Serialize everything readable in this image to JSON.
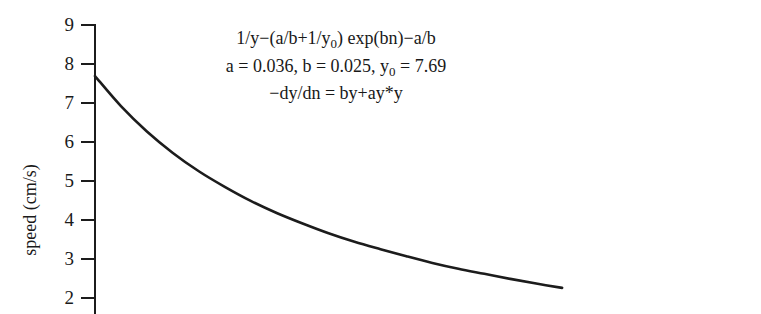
{
  "chart_data": {
    "type": "line",
    "title": "",
    "xlabel": "",
    "ylabel": "speed (cm/s)",
    "grid": false,
    "legend": null,
    "yticks": [
      9,
      8,
      7,
      6,
      5,
      4,
      3,
      2
    ],
    "ytick_labels": [
      "9",
      "8",
      "7",
      "6",
      "5",
      "4",
      "3",
      "2"
    ],
    "ylim": [
      2,
      9
    ],
    "xlim": [
      0,
      105
    ],
    "series": [
      {
        "name": "speed",
        "x": [
          0,
          5,
          10,
          15,
          20,
          25,
          30,
          35,
          40,
          45,
          50,
          55,
          60,
          65,
          70,
          75,
          80,
          85,
          90
        ],
        "y": [
          7.69,
          6.92,
          6.27,
          5.72,
          5.25,
          4.85,
          4.49,
          4.18,
          3.91,
          3.66,
          3.44,
          3.25,
          3.07,
          2.9,
          2.75,
          2.62,
          2.49,
          2.37,
          2.26
        ]
      }
    ],
    "annotations": {
      "equation_line1_parts": {
        "a": "1/y−(a/b+1/y",
        "sub": "0",
        "b": ") exp(bn)−a/b"
      },
      "equation_line2_parts": {
        "a": "a = 0.036, b = 0.025, y",
        "sub": "0",
        "b": " = 7.69"
      },
      "equation_line3": "−dy/dn = by+ay*y",
      "parameters": {
        "a": 0.036,
        "b": 0.025,
        "y0": 7.69
      }
    },
    "colors": {
      "curve": "#1c1c1c",
      "axis": "#1c1c1c",
      "text": "#1a1a1a",
      "background": "#ffffff"
    }
  }
}
